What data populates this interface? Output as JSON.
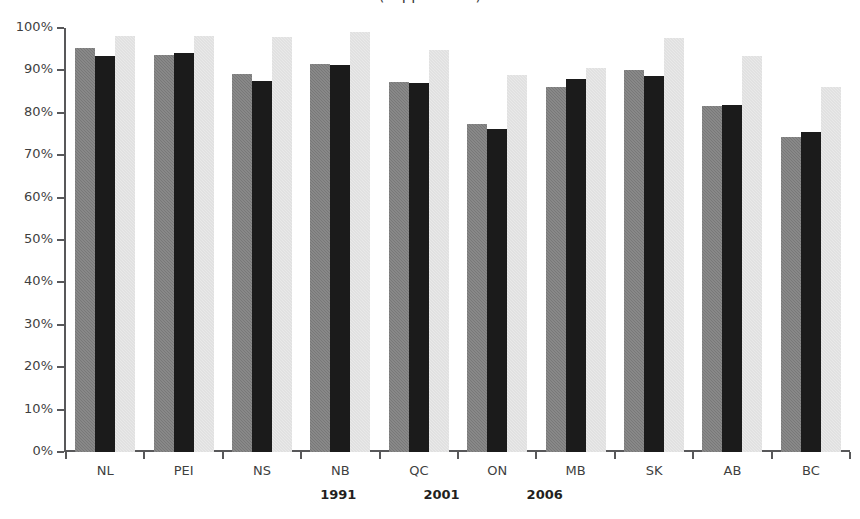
{
  "chart_data": {
    "type": "bar",
    "title": "(clipped title)",
    "xlabel": "",
    "ylabel": "",
    "ylim": [
      0,
      100
    ],
    "y_tick_labels": [
      "100%",
      "90%",
      "80%",
      "70%",
      "60%",
      "50%",
      "40%",
      "30%",
      "20%",
      "10%",
      "0%"
    ],
    "y_tick_values": [
      100,
      90,
      80,
      70,
      60,
      50,
      40,
      30,
      20,
      10,
      0
    ],
    "grid": false,
    "legend_position": "bottom-center",
    "categories": [
      "NL",
      "PEI",
      "NS",
      "NB",
      "QC",
      "ON",
      "MB",
      "SK",
      "AB",
      "BC"
    ],
    "series": [
      {
        "name": "1991",
        "color": "#787878",
        "values": [
          95.3,
          93.6,
          89.2,
          91.6,
          87.3,
          77.4,
          86.0,
          90.1,
          81.5,
          74.2
        ]
      },
      {
        "name": "2001",
        "color": "#1b1b1b",
        "values": [
          93.5,
          94.2,
          87.5,
          91.2,
          87.0,
          76.2,
          87.9,
          88.6,
          81.9,
          75.5
        ]
      },
      {
        "name": "2006",
        "color": "#e9e9e9",
        "values": [
          98.0,
          98.0,
          97.8,
          99.0,
          94.9,
          89.0,
          90.6,
          97.7,
          93.5,
          86.0
        ]
      }
    ]
  }
}
